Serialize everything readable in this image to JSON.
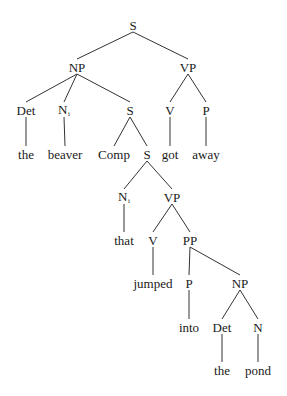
{
  "diagram": {
    "type": "syntax-tree",
    "colors": {
      "line": "#333333",
      "text": "#1a1a1a",
      "background": "#ffffff"
    },
    "nodes": [
      {
        "id": "S0",
        "label": "S",
        "sub": "",
        "x": 133,
        "y": 25
      },
      {
        "id": "NP1",
        "label": "NP",
        "sub": "",
        "x": 77,
        "y": 67
      },
      {
        "id": "VP1",
        "label": "VP",
        "sub": "",
        "x": 188,
        "y": 67
      },
      {
        "id": "Det1",
        "label": "Det",
        "sub": "",
        "x": 26,
        "y": 110
      },
      {
        "id": "N1",
        "label": "N",
        "sub": "i",
        "x": 64,
        "y": 110
      },
      {
        "id": "S1",
        "label": "S",
        "sub": "",
        "x": 130,
        "y": 110
      },
      {
        "id": "V1",
        "label": "V",
        "sub": "",
        "x": 170,
        "y": 110
      },
      {
        "id": "P1",
        "label": "P",
        "sub": "",
        "x": 206,
        "y": 110
      },
      {
        "id": "the1",
        "label": "the",
        "sub": "",
        "x": 26,
        "y": 154
      },
      {
        "id": "beaver",
        "label": "beaver",
        "sub": "",
        "x": 65,
        "y": 154
      },
      {
        "id": "Comp",
        "label": "Comp",
        "sub": "",
        "x": 114,
        "y": 154
      },
      {
        "id": "S2",
        "label": "S",
        "sub": "",
        "x": 147,
        "y": 154
      },
      {
        "id": "got",
        "label": "got",
        "sub": "",
        "x": 170,
        "y": 154
      },
      {
        "id": "away",
        "label": "away",
        "sub": "",
        "x": 206,
        "y": 154
      },
      {
        "id": "N2",
        "label": "N",
        "sub": "i",
        "x": 124,
        "y": 197
      },
      {
        "id": "VP2",
        "label": "VP",
        "sub": "",
        "x": 172,
        "y": 197
      },
      {
        "id": "that",
        "label": "that",
        "sub": "",
        "x": 124,
        "y": 240
      },
      {
        "id": "V2",
        "label": "V",
        "sub": "",
        "x": 153,
        "y": 240
      },
      {
        "id": "PP",
        "label": "PP",
        "sub": "",
        "x": 190,
        "y": 240
      },
      {
        "id": "jumped",
        "label": "jumped",
        "sub": "",
        "x": 153,
        "y": 283
      },
      {
        "id": "P2",
        "label": "P",
        "sub": "",
        "x": 189,
        "y": 283
      },
      {
        "id": "NP2",
        "label": "NP",
        "sub": "",
        "x": 240,
        "y": 283
      },
      {
        "id": "into",
        "label": "into",
        "sub": "",
        "x": 189,
        "y": 327
      },
      {
        "id": "Det2",
        "label": "Det",
        "sub": "",
        "x": 222,
        "y": 327
      },
      {
        "id": "N3",
        "label": "N",
        "sub": "",
        "x": 258,
        "y": 327
      },
      {
        "id": "the2",
        "label": "the",
        "sub": "",
        "x": 222,
        "y": 370
      },
      {
        "id": "pond",
        "label": "pond",
        "sub": "",
        "x": 258,
        "y": 370
      }
    ],
    "edges": [
      [
        "S0",
        "NP1"
      ],
      [
        "S0",
        "VP1"
      ],
      [
        "NP1",
        "Det1"
      ],
      [
        "NP1",
        "N1"
      ],
      [
        "NP1",
        "S1"
      ],
      [
        "VP1",
        "V1"
      ],
      [
        "VP1",
        "P1"
      ],
      [
        "Det1",
        "the1"
      ],
      [
        "N1",
        "beaver"
      ],
      [
        "S1",
        "Comp"
      ],
      [
        "S1",
        "S2"
      ],
      [
        "V1",
        "got"
      ],
      [
        "P1",
        "away"
      ],
      [
        "S2",
        "N2"
      ],
      [
        "S2",
        "VP2"
      ],
      [
        "N2",
        "that"
      ],
      [
        "VP2",
        "V2"
      ],
      [
        "VP2",
        "PP"
      ],
      [
        "V2",
        "jumped"
      ],
      [
        "PP",
        "P2"
      ],
      [
        "PP",
        "NP2"
      ],
      [
        "P2",
        "into"
      ],
      [
        "NP2",
        "Det2"
      ],
      [
        "NP2",
        "N3"
      ],
      [
        "Det2",
        "the2"
      ],
      [
        "N3",
        "pond"
      ]
    ]
  }
}
